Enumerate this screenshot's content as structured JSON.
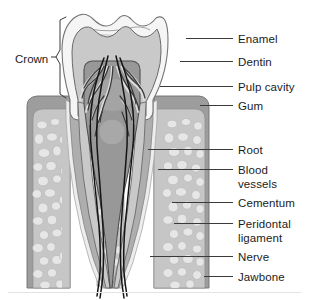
{
  "diagram": {
    "background_color": "#ffffff",
    "text_color": "#1b1b1b",
    "leader_line_color": "#3a3a3a",
    "labels_right": [
      {
        "id": "enamel",
        "text": "Enamel",
        "text2": "",
        "x": 238,
        "y": 33,
        "line_x1": 186,
        "line_y1": 38,
        "line_x2": 233,
        "line_y2": 38
      },
      {
        "id": "dentin",
        "text": "Dentin",
        "text2": "",
        "x": 238,
        "y": 56,
        "line_x1": 180,
        "line_y1": 61,
        "line_x2": 233,
        "line_y2": 61
      },
      {
        "id": "pulp-cavity",
        "text": "Pulp cavity",
        "text2": "",
        "x": 238,
        "y": 81,
        "line_x1": 160,
        "line_y1": 86,
        "line_x2": 233,
        "line_y2": 86
      },
      {
        "id": "gum",
        "text": "Gum",
        "text2": "",
        "x": 238,
        "y": 100,
        "line_x1": 200,
        "line_y1": 105,
        "line_x2": 233,
        "line_y2": 105
      },
      {
        "id": "root",
        "text": "Root",
        "text2": "",
        "x": 238,
        "y": 144,
        "line_x1": 148,
        "line_y1": 149,
        "line_x2": 233,
        "line_y2": 149
      },
      {
        "id": "blood-vessels",
        "text": "Blood",
        "text2": "vessels",
        "x": 238,
        "y": 164,
        "line_x1": 158,
        "line_y1": 169,
        "line_x2": 233,
        "line_y2": 169
      },
      {
        "id": "cementum",
        "text": "Cementum",
        "text2": "",
        "x": 238,
        "y": 197,
        "line_x1": 172,
        "line_y1": 202,
        "line_x2": 233,
        "line_y2": 202
      },
      {
        "id": "periodontal-ligament",
        "text": "Peridontal",
        "text2": "ligament",
        "x": 238,
        "y": 218,
        "line_x1": 174,
        "line_y1": 223,
        "line_x2": 233,
        "line_y2": 223
      },
      {
        "id": "nerve",
        "text": "Nerve",
        "text2": "",
        "x": 238,
        "y": 251,
        "line_x1": 150,
        "line_y1": 256,
        "line_x2": 233,
        "line_y2": 256
      },
      {
        "id": "jawbone",
        "text": "Jawbone",
        "text2": "",
        "x": 238,
        "y": 271,
        "line_x1": 204,
        "line_y1": 276,
        "line_x2": 233,
        "line_y2": 276
      }
    ],
    "labels_left": [
      {
        "id": "crown",
        "text": "Crown",
        "x": 15,
        "y": 53
      }
    ],
    "colors": {
      "enamel": "#f2f2f2",
      "enamel_outline": "#6f6f6f",
      "dentin": "#c9c9c9",
      "dentin_outline": "#6b6b6b",
      "pulp": "#9a9a9a",
      "pulp_outline": "#545454",
      "gum": "#9d9d9d",
      "gum_outline": "#6b6b6b",
      "jawbone": "#c2c2c2",
      "jawbone_spongy": "#dedede",
      "cementum": "#b0b0b0",
      "periodontal": "#e8e8e8",
      "nerve": "#161616",
      "vessel_light": "#dcdcdc",
      "vessel_dark": "#3b3b3b"
    }
  }
}
